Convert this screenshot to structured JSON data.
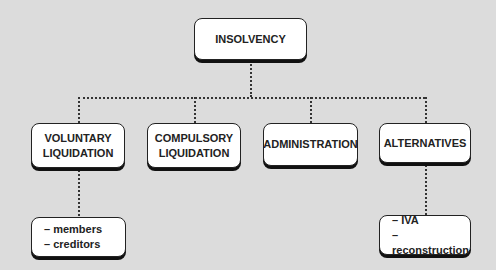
{
  "diagram": {
    "root": {
      "label": "INSOLVENCY"
    },
    "children": [
      {
        "label_line1": "VOLUNTARY",
        "label_line2": "LIQUIDATION",
        "details": [
          "– members",
          "– creditors"
        ]
      },
      {
        "label_line1": "COMPULSORY",
        "label_line2": "LIQUIDATION"
      },
      {
        "label": "ADMINISTRATION"
      },
      {
        "label": "ALTERNATIVES",
        "details": [
          "– IVA",
          "– reconstruction"
        ]
      }
    ]
  },
  "colors": {
    "background": "#dcdcdc",
    "box_fill": "#ffffff",
    "stroke": "#222222"
  }
}
